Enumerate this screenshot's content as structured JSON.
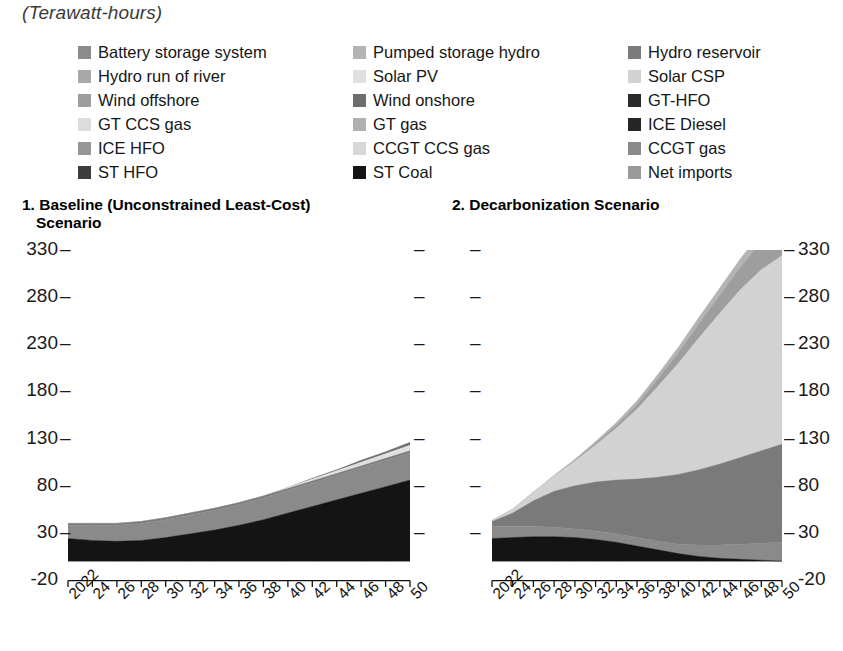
{
  "units_title": "(Terawatt-hours)",
  "legend": {
    "items": [
      {
        "label": "Battery storage system",
        "color": "#8c8c8c",
        "col": 1
      },
      {
        "label": "Pumped storage hydro",
        "color": "#b4b4b4",
        "col": 2
      },
      {
        "label": "Hydro reservoir",
        "color": "#7a7a7a",
        "col": 3
      },
      {
        "label": "Hydro run of river",
        "color": "#a8a8a8",
        "col": 1
      },
      {
        "label": "Solar PV",
        "color": "#e0e0e0",
        "col": 2
      },
      {
        "label": "Solar CSP",
        "color": "#d2d2d2",
        "col": 3
      },
      {
        "label": "Wind offshore",
        "color": "#9e9e9e",
        "col": 1
      },
      {
        "label": "Wind onshore",
        "color": "#6e6e6e",
        "col": 2
      },
      {
        "label": "GT-HFO",
        "color": "#2a2a2a",
        "col": 3
      },
      {
        "label": "GT CCS gas",
        "color": "#dcdcdc",
        "col": 1
      },
      {
        "label": "GT gas",
        "color": "#b0b0b0",
        "col": 2
      },
      {
        "label": "ICE Diesel",
        "color": "#262626",
        "col": 3
      },
      {
        "label": "ICE HFO",
        "color": "#969696",
        "col": 1
      },
      {
        "label": "CCGT CCS gas",
        "color": "#d8d8d8",
        "col": 2
      },
      {
        "label": "CCGT gas",
        "color": "#8a8a8a",
        "col": 3
      },
      {
        "label": "ST HFO",
        "color": "#3c3c3c",
        "col": 1
      },
      {
        "label": "ST Coal",
        "color": "#141414",
        "col": 2
      },
      {
        "label": "Net imports",
        "color": "#9a9a9a",
        "col": 3
      }
    ]
  },
  "panels": {
    "panel1": {
      "number": "1.",
      "title_line1": "Baseline (Unconstrained Least-Cost)",
      "title_line2": "Scenario"
    },
    "panel2": {
      "number": "2.",
      "title": "Decarbonization Scenario"
    }
  },
  "axis": {
    "y_ticks": [
      330,
      280,
      230,
      180,
      130,
      80,
      30,
      -20
    ],
    "y_min": -20,
    "y_max": 330,
    "x_ticks": [
      "2022",
      "24",
      "26",
      "28",
      "30",
      "32",
      "34",
      "36",
      "38",
      "40",
      "42",
      "44",
      "46",
      "48",
      "50"
    ]
  },
  "chart_data": {
    "type": "area",
    "title": "(Terawatt-hours)",
    "xlabel": "",
    "ylabel": "Terawatt-hours",
    "ylim": [
      -20,
      330
    ],
    "grid": false,
    "legend_position": "top",
    "x": [
      2022,
      2024,
      2026,
      2028,
      2030,
      2032,
      2034,
      2036,
      2038,
      2040,
      2042,
      2044,
      2046,
      2048,
      2050
    ],
    "panels": [
      {
        "name": "1. Baseline (Unconstrained Least-Cost) Scenario",
        "series": [
          {
            "name": "ST Coal",
            "color": "#141414",
            "values": [
              24,
              22,
              21,
              22,
              25,
              29,
              33,
              38,
              44,
              51,
              58,
              65,
              72,
              79,
              86
            ]
          },
          {
            "name": "CCGT gas",
            "color": "#8a8a8a",
            "values": [
              14,
              16,
              17,
              18,
              19,
              20,
              21,
              22,
              23,
              24,
              25,
              26,
              27,
              28,
              29
            ]
          },
          {
            "name": "Hydro reservoir",
            "color": "#7a7a7a",
            "values": [
              2,
              2,
              2,
              2,
              2,
              2,
              2,
              2,
              2,
              2,
              2,
              2,
              2,
              2,
              2
            ]
          },
          {
            "name": "Solar PV",
            "color": "#e0e0e0",
            "values": [
              0,
              0,
              0,
              0,
              0,
              0,
              0,
              0,
              0,
              1,
              2,
              3,
              4,
              5,
              6
            ]
          },
          {
            "name": "Wind onshore",
            "color": "#6e6e6e",
            "values": [
              0,
              0,
              0,
              0,
              0,
              0,
              0,
              0,
              0,
              0,
              1,
              1,
              2,
              2,
              3
            ]
          }
        ],
        "totals_2022": 40,
        "totals_2050": 126
      },
      {
        "name": "2. Decarbonization Scenario",
        "series": [
          {
            "name": "ST Coal",
            "color": "#141414",
            "values": [
              24,
              25,
              26,
              26,
              25,
              23,
              20,
              16,
              12,
              8,
              5,
              3,
              2,
              1,
              0
            ]
          },
          {
            "name": "CCGT gas",
            "color": "#8a8a8a",
            "values": [
              13,
              12,
              11,
              10,
              9,
              9,
              9,
              9,
              9,
              10,
              12,
              14,
              16,
              18,
              20
            ]
          },
          {
            "name": "Hydro reservoir",
            "color": "#7a7a7a",
            "values": [
              5,
              14,
              27,
              38,
              46,
              52,
              57,
              62,
              68,
              74,
              80,
              86,
              92,
              98,
              104
            ]
          },
          {
            "name": "Solar PV",
            "color": "#d2d2d2",
            "values": [
              1,
              4,
              9,
              16,
              26,
              39,
              55,
              74,
              96,
              118,
              140,
              160,
              178,
              192,
              200
            ]
          },
          {
            "name": "Wind offshore",
            "color": "#9e9e9e",
            "values": [
              0,
              0,
              0,
              0,
              1,
              2,
              3,
              5,
              8,
              11,
              15,
              19,
              24,
              30,
              36
            ]
          },
          {
            "name": "Net imports",
            "color": "#b4b4b4",
            "values": [
              0,
              0,
              0,
              1,
              1,
              2,
              3,
              4,
              5,
              6,
              7,
              8,
              9,
              10,
              11
            ]
          }
        ],
        "totals_2022": 43,
        "totals_2050": 310
      }
    ]
  }
}
